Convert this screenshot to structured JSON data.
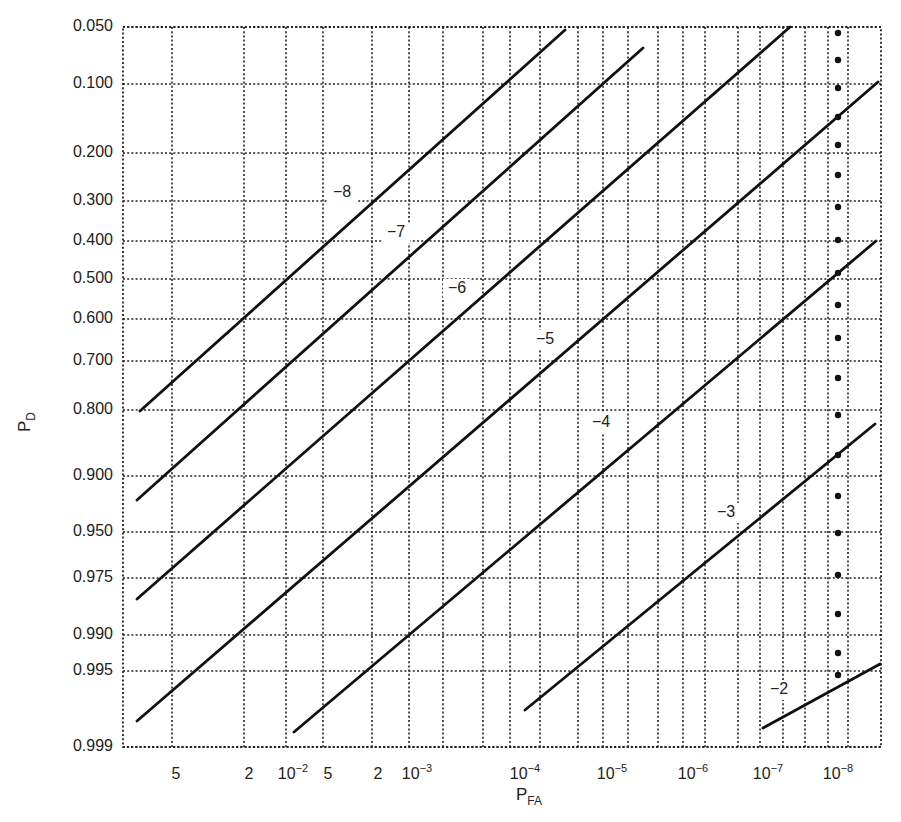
{
  "chart_data": {
    "type": "line",
    "title": "",
    "xlabel": "P_FA",
    "ylabel": "P_D",
    "grid": true,
    "legend": "none (curves labeled inline)",
    "xscale": "log (normal-probability paper style)",
    "yscale": "normal probability",
    "x_tick_labels": [
      "5",
      "2",
      "10^-2",
      "5",
      "2",
      "10^-3",
      "10^-4",
      "10^-5",
      "10^-6",
      "10^-7",
      "10^-8"
    ],
    "y_tick_labels": [
      "0.050",
      "0.100",
      "0.200",
      "0.300",
      "0.400",
      "0.500",
      "0.600",
      "0.700",
      "0.800",
      "0.900",
      "0.950",
      "0.975",
      "0.990",
      "0.995",
      "0.999"
    ],
    "series": [
      {
        "name": "-8",
        "label": "−8",
        "p_d_start": 0.8,
        "p_d_end": 0.05,
        "pfa_start": "~3e-2 (left edge)",
        "pfa_end": "~3e-5"
      },
      {
        "name": "-7",
        "label": "−7",
        "p_d_start": 0.92,
        "p_d_end": 0.07,
        "pfa_start": "~3e-2 (left edge)",
        "pfa_end": "~6e-6"
      },
      {
        "name": "-6",
        "label": "−6",
        "p_d_start": 0.98,
        "p_d_end": 0.05,
        "pfa_start": "~3e-2 (left edge)",
        "pfa_end": "~5e-8"
      },
      {
        "name": "-5",
        "label": "−5",
        "p_d_start": 0.998,
        "p_d_end": 0.1,
        "pfa_start": "~3e-2 (left edge)",
        "pfa_end": "~3e-9"
      },
      {
        "name": "-4",
        "label": "−4",
        "p_d_start": 0.998,
        "p_d_end": 0.4,
        "pfa_start": "~1e-2",
        "pfa_end": "~3e-9"
      },
      {
        "name": "-3",
        "label": "−3",
        "p_d_start": 0.998,
        "p_d_end": 0.85,
        "pfa_start": "~1e-4",
        "pfa_end": "~3e-9"
      },
      {
        "name": "-2",
        "label": "−2",
        "p_d_start": 0.998,
        "p_d_end": 0.993,
        "pfa_start": "~1e-7",
        "pfa_end": "~3e-9"
      }
    ],
    "annotations": [
      "Column of large dots along P_FA = 10^-8 marker line"
    ]
  },
  "plot": {
    "frame": {
      "x0": 123,
      "y0": 27,
      "x1": 881,
      "y1": 747
    },
    "y_grid": [
      {
        "label": "0.050",
        "y": 27
      },
      {
        "label": "0.100",
        "y": 84
      },
      {
        "label": "0.200",
        "y": 153
      },
      {
        "label": "0.300",
        "y": 201
      },
      {
        "label": "0.400",
        "y": 241
      },
      {
        "label": "0.500",
        "y": 279
      },
      {
        "label": "0.600",
        "y": 319
      },
      {
        "label": "0.700",
        "y": 361
      },
      {
        "label": "0.800",
        "y": 410
      },
      {
        "label": "0.900",
        "y": 476
      },
      {
        "label": "0.950",
        "y": 532
      },
      {
        "label": "0.975",
        "y": 578
      },
      {
        "label": "0.990",
        "y": 635
      },
      {
        "label": "0.995",
        "y": 671
      },
      {
        "label": "0.999",
        "y": 747
      }
    ],
    "x_grid": [
      172,
      244,
      286,
      323,
      372,
      409,
      443,
      483,
      510,
      540,
      578,
      603,
      628,
      658,
      683,
      705,
      738,
      760,
      783,
      805,
      828,
      848
    ],
    "x_ticks": [
      {
        "base": "5",
        "sup": "",
        "x": 176
      },
      {
        "base": "2",
        "sup": "",
        "x": 249
      },
      {
        "base": "10",
        "sup": "−2",
        "x": 293
      },
      {
        "base": "5",
        "sup": "",
        "x": 328
      },
      {
        "base": "2",
        "sup": "",
        "x": 378
      },
      {
        "base": "10",
        "sup": "−3",
        "x": 417
      },
      {
        "base": "10",
        "sup": "−4",
        "x": 525
      },
      {
        "base": "10",
        "sup": "−5",
        "x": 612
      },
      {
        "base": "10",
        "sup": "−6",
        "x": 693
      },
      {
        "base": "10",
        "sup": "−7",
        "x": 768
      },
      {
        "base": "10",
        "sup": "−8",
        "x": 838
      }
    ],
    "curves": [
      {
        "label": "−8",
        "x1": 140,
        "y1": 411,
        "x2": 565,
        "y2": 30,
        "lx": 342,
        "ly": 193
      },
      {
        "label": "−7",
        "x1": 137,
        "y1": 500,
        "x2": 643,
        "y2": 48,
        "lx": 396,
        "ly": 233
      },
      {
        "label": "−6",
        "x1": 137,
        "y1": 599,
        "x2": 790,
        "y2": 27,
        "lx": 457,
        "ly": 289
      },
      {
        "label": "−5",
        "x1": 137,
        "y1": 721,
        "x2": 878,
        "y2": 82,
        "lx": 545,
        "ly": 340
      },
      {
        "label": "−4",
        "x1": 294,
        "y1": 732,
        "x2": 876,
        "y2": 241,
        "lx": 601,
        "ly": 423
      },
      {
        "label": "−3",
        "x1": 525,
        "y1": 710,
        "x2": 875,
        "y2": 424,
        "lx": 726,
        "ly": 513
      },
      {
        "label": "−2",
        "x1": 763,
        "y1": 728,
        "x2": 880,
        "y2": 664,
        "lx": 779,
        "ly": 690
      }
    ],
    "dots": {
      "x": 838,
      "ys": [
        33,
        60,
        88,
        117,
        145,
        175,
        207,
        240,
        273,
        305,
        338,
        378,
        415,
        455,
        496,
        533,
        575,
        614,
        653,
        675
      ]
    },
    "axis_labels": {
      "x": {
        "base": "P",
        "sub": "FA",
        "x": 516,
        "y": 800
      },
      "y": {
        "base": "P",
        "sub": "D",
        "x": 30,
        "y": 432
      }
    }
  }
}
